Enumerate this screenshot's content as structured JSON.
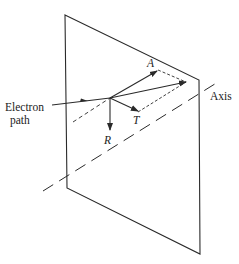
{
  "diagram": {
    "labels": {
      "electron_path_line1": "Electron",
      "electron_path_line2": "path",
      "axis": "Axis",
      "vector_a": "A",
      "vector_t": "T",
      "vector_r": "R"
    },
    "colors": {
      "stroke": "#2a2a2a",
      "background": "#ffffff"
    }
  }
}
